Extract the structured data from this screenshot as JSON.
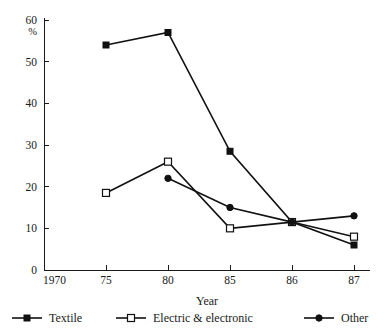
{
  "chart_data": {
    "type": "line",
    "title": "",
    "subtitle": "",
    "xlabel": "Year",
    "ylabel": "%",
    "x": [
      "1970",
      "75",
      "80",
      "85",
      "86",
      "87"
    ],
    "xtick_labels": [
      "1970",
      "75",
      "80",
      "85",
      "86",
      "87"
    ],
    "ytick_labels": [
      "0",
      "10",
      "20",
      "30",
      "40",
      "50",
      "60"
    ],
    "ytick_values": [
      0,
      10,
      20,
      30,
      40,
      50,
      60
    ],
    "ylim": [
      0,
      60
    ],
    "grid": false,
    "legend_position": "bottom",
    "series": [
      {
        "name": "Textile",
        "marker": "filled-square",
        "color": "#111111",
        "points": [
          {
            "x": "75",
            "y": 54
          },
          {
            "x": "80",
            "y": 57
          },
          {
            "x": "85",
            "y": 28.5
          },
          {
            "x": "86",
            "y": 11.5
          },
          {
            "x": "87",
            "y": 6
          }
        ]
      },
      {
        "name": "Electric & electronic",
        "marker": "open-square",
        "color": "#111111",
        "points": [
          {
            "x": "75",
            "y": 18.5
          },
          {
            "x": "80",
            "y": 26
          },
          {
            "x": "85",
            "y": 10
          },
          {
            "x": "86",
            "y": 11.5
          },
          {
            "x": "87",
            "y": 8
          }
        ]
      },
      {
        "name": "Other",
        "marker": "filled-circle",
        "color": "#111111",
        "points": [
          {
            "x": "80",
            "y": 22
          },
          {
            "x": "85",
            "y": 15
          },
          {
            "x": "86",
            "y": 11.5
          },
          {
            "x": "87",
            "y": 13
          }
        ]
      }
    ]
  },
  "axis": {
    "y_unit": "%",
    "x_title": "Year"
  },
  "legend": {
    "items": [
      {
        "label": "Textile",
        "marker": "filled-square"
      },
      {
        "label": "Electric & electronic",
        "marker": "open-square"
      },
      {
        "label": "Other",
        "marker": "filled-circle"
      }
    ]
  },
  "colors": {
    "ink": "#111111",
    "background": "#ffffff"
  }
}
